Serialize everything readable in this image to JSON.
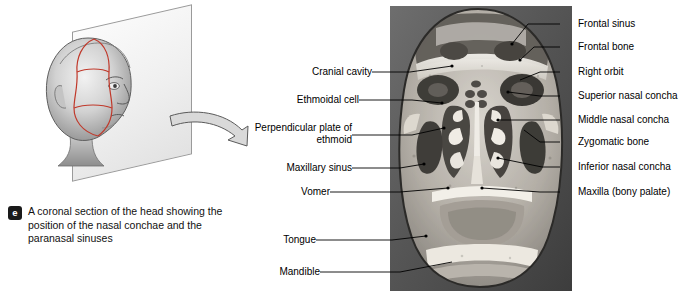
{
  "figure": {
    "badge": "e",
    "caption": "A coronal section of the head showing the position of the nasal conchae and the paranasal sinuses"
  },
  "labels_left": [
    {
      "name": "cranial-cavity",
      "text": "Cranial cavity"
    },
    {
      "name": "ethmoidal-cell",
      "text": "Ethmoidal cell"
    },
    {
      "name": "perpendicular-plate-of-ethmoid",
      "text": "Perpendicular\nplate of ethmoid"
    },
    {
      "name": "maxillary-sinus",
      "text": "Maxillary sinus"
    },
    {
      "name": "vomer",
      "text": "Vomer"
    },
    {
      "name": "tongue",
      "text": "Tongue"
    },
    {
      "name": "mandible",
      "text": "Mandible"
    }
  ],
  "labels_right": [
    {
      "name": "frontal-sinus",
      "text": "Frontal sinus"
    },
    {
      "name": "frontal-bone",
      "text": "Frontal bone"
    },
    {
      "name": "right-orbit",
      "text": "Right orbit"
    },
    {
      "name": "superior-nasal-concha",
      "text": "Superior nasal concha"
    },
    {
      "name": "middle-nasal-concha",
      "text": "Middle nasal concha"
    },
    {
      "name": "zygomatic-bone",
      "text": "Zygomatic bone"
    },
    {
      "name": "inferior-nasal-concha",
      "text": "Inferior nasal concha"
    },
    {
      "name": "maxilla-bony-palate",
      "text": "Maxilla (bony palate)"
    }
  ],
  "illustration": {
    "head_alt": "shaded line drawing of a head in profile with coronal section plane",
    "plane_alt": "transparent sectional plane through the head",
    "arrow_alt": "curved arrow pointing from illustration to photograph"
  },
  "colors": {
    "section_line": "#c0392b",
    "badge_background": "#1a1a1a",
    "badge_text": "#ffffff",
    "leader_line": "#000000",
    "plane_fill": "#eeeeee"
  }
}
